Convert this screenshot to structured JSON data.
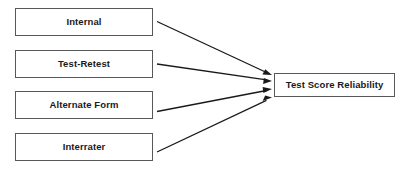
{
  "diagram": {
    "title": "Test Score Reliability",
    "type": "convergent-arrow-diagram",
    "background_color": "#ffffff",
    "box_border_color": "#58585a",
    "arrow_color": "#1a1a1a",
    "text_color": "#1a1a1a",
    "sources": [
      {
        "id": "internal",
        "label": "Internal"
      },
      {
        "id": "test-retest",
        "label": "Test-Retest"
      },
      {
        "id": "alternate-form",
        "label": "Alternate Form"
      },
      {
        "id": "interrater",
        "label": "Interrater"
      }
    ],
    "target": {
      "id": "test-score-reliability",
      "label": "Test Score Reliability"
    },
    "arrows": [
      {
        "from": "internal",
        "to": "test-score-reliability",
        "icon": "arrow-right-icon"
      },
      {
        "from": "test-retest",
        "to": "test-score-reliability",
        "icon": "arrow-right-icon"
      },
      {
        "from": "alternate-form",
        "to": "test-score-reliability",
        "icon": "arrow-right-icon"
      },
      {
        "from": "interrater",
        "to": "test-score-reliability",
        "icon": "arrow-right-icon"
      }
    ]
  }
}
